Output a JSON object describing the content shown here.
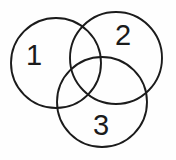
{
  "figure": {
    "kind": "venn-diagram",
    "background_color": "#fefefe",
    "stroke_color": "#1b1b1b",
    "label_color": "#1b1b1b",
    "width": 176,
    "height": 160
  },
  "circles": [
    {
      "id": "circle-1",
      "label": "1",
      "cx": 56,
      "cy": 63,
      "r": 45,
      "label_x": 34,
      "label_y": 57
    },
    {
      "id": "circle-2",
      "label": "2",
      "cx": 116,
      "cy": 58,
      "r": 46,
      "label_x": 123,
      "label_y": 37
    },
    {
      "id": "circle-3",
      "label": "3",
      "cx": 102,
      "cy": 102,
      "r": 45,
      "label_x": 101,
      "label_y": 127
    }
  ]
}
